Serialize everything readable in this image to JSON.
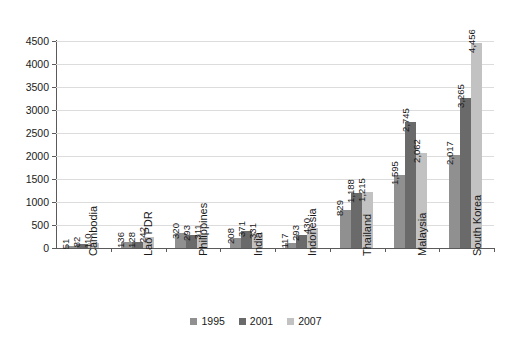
{
  "chart_data": {
    "type": "bar",
    "title": "",
    "subtitle": "",
    "xlabel": "",
    "ylabel": "",
    "categories": [
      "Cambodia",
      "Lao PDR",
      "Philippines",
      "India",
      "Indonesia",
      "Thailand",
      "Malaysia",
      "South Korea"
    ],
    "series": [
      {
        "name": "1995",
        "color": "#909090",
        "values": [
          51,
          136,
          320,
          208,
          117,
          829,
          1595,
          2017
        ],
        "labels": [
          "51",
          "136",
          "320",
          "208",
          "117",
          "829",
          "1,595",
          "2,017"
        ]
      },
      {
        "name": "2001",
        "color": "#6a6a6a",
        "values": [
          82,
          128,
          293,
          371,
          293,
          1188,
          2745,
          3265
        ],
        "labels": [
          "82",
          "128",
          "293",
          "371",
          "293",
          "1,188",
          "2,745",
          "3,265"
        ]
      },
      {
        "name": "2007",
        "color": "#c2c2c2",
        "values": [
          110,
          242,
          311,
          331,
          430,
          1215,
          2062,
          4456
        ],
        "labels": [
          "110",
          "242",
          "311",
          "331",
          "430",
          "1,215",
          "2,062",
          "4,456"
        ]
      }
    ],
    "ylim": [
      0,
      4500
    ],
    "ytick_step": 500,
    "yticks": [
      0,
      500,
      1000,
      1500,
      2000,
      2500,
      3000,
      3500,
      4000,
      4500
    ],
    "ytick_labels": [
      "0",
      "500",
      "1000",
      "1500",
      "2000",
      "2500",
      "3000",
      "3500",
      "4000",
      "4500"
    ],
    "grid": true,
    "legend_position": "bottom",
    "data_labels": true,
    "data_label_orientation": "vertical",
    "category_label_orientation": "vertical"
  },
  "legend": {
    "items": [
      {
        "label": "1995",
        "color": "#909090"
      },
      {
        "label": "2001",
        "color": "#6a6a6a"
      },
      {
        "label": "2007",
        "color": "#c2c2c2"
      }
    ]
  }
}
